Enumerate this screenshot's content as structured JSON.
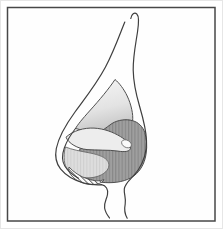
{
  "window": {
    "width": 223,
    "height": 229
  },
  "figure": {
    "kind": "medical-line-illustration",
    "frame": {
      "stroke": "#474747",
      "background": "#fefefe"
    },
    "colors": {
      "profile_line": "#3f3f3f",
      "region_outline": "#4f4f4f",
      "soft_outline": "#6a6a6a"
    },
    "regions": {
      "nasal_bone": {
        "name": "upper gradient-shaded triangular region",
        "fill_top": "#f7f7f7",
        "fill_bottom": "#c7c7c7"
      },
      "deep_lateral": {
        "name": "dark vertically striped deep region",
        "base": "#9f9f9f",
        "stripe": "#878787"
      },
      "lateral_band": {
        "name": "pale curved cartilage band",
        "fill": "#ededed",
        "tip_fill": "#fafafa"
      },
      "tip_lobule": {
        "name": "light vertically striped tip lobule region",
        "base": "#dddddd",
        "stripe": "#cecece"
      },
      "alar_crescent": {
        "name": "diagonally hatched crescent at alar rim",
        "base": "#fdfdfd",
        "stripe": "#5f5f5f"
      }
    }
  }
}
